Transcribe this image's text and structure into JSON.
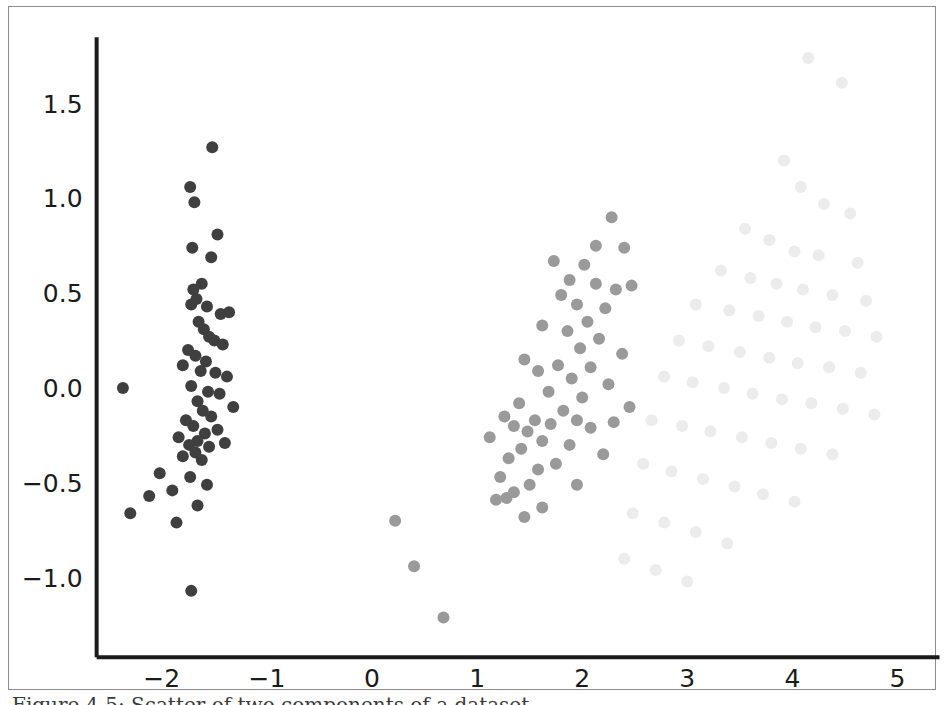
{
  "figure": {
    "background_color": "#ffffff",
    "frame_color": "#8d8d8d",
    "axis_color": "#1b1b1b"
  },
  "caption": {
    "text": "Figure 4-5: Scatter of two components of a dataset"
  },
  "chart_data": {
    "type": "scatter",
    "title": "",
    "xlabel": "",
    "ylabel": "",
    "xlim": [
      -2.62,
      5.4
    ],
    "ylim": [
      -1.42,
      1.85
    ],
    "xticks": [
      -2,
      -1,
      0,
      1,
      2,
      3,
      4,
      5
    ],
    "xticklabels": [
      "−2",
      "−1",
      "0",
      "1",
      "2",
      "3",
      "4",
      "5"
    ],
    "yticks": [
      -1.0,
      -0.5,
      0.0,
      0.5,
      1.0,
      1.5
    ],
    "yticklabels": [
      "−1.0",
      "−0.5",
      "0.0",
      "0.5",
      "1.0",
      "1.5"
    ],
    "grid": false,
    "legend": null,
    "marker": "circle",
    "marker_size": 11,
    "spines": {
      "left": true,
      "bottom": true,
      "top": false,
      "right": false
    },
    "series": [
      {
        "name": "cluster-dark",
        "color": "#3f3f3f",
        "opacity": 1.0,
        "points": [
          [
            -1.52,
            1.27
          ],
          [
            -1.73,
            1.06
          ],
          [
            -1.69,
            0.98
          ],
          [
            -1.47,
            0.81
          ],
          [
            -1.71,
            0.74
          ],
          [
            -1.53,
            0.69
          ],
          [
            -1.62,
            0.55
          ],
          [
            -1.7,
            0.52
          ],
          [
            -1.67,
            0.47
          ],
          [
            -1.72,
            0.44
          ],
          [
            -1.57,
            0.43
          ],
          [
            -1.36,
            0.4
          ],
          [
            -1.44,
            0.39
          ],
          [
            -1.65,
            0.35
          ],
          [
            -1.6,
            0.31
          ],
          [
            -1.55,
            0.27
          ],
          [
            -1.5,
            0.25
          ],
          [
            -1.42,
            0.23
          ],
          [
            -1.75,
            0.2
          ],
          [
            -1.68,
            0.17
          ],
          [
            -1.58,
            0.14
          ],
          [
            -1.8,
            0.12
          ],
          [
            -1.63,
            0.09
          ],
          [
            -1.49,
            0.08
          ],
          [
            -1.38,
            0.06
          ],
          [
            -2.37,
            0.0
          ],
          [
            -1.72,
            0.01
          ],
          [
            -1.56,
            -0.02
          ],
          [
            -1.45,
            -0.03
          ],
          [
            -1.66,
            -0.07
          ],
          [
            -1.32,
            -0.1
          ],
          [
            -1.61,
            -0.12
          ],
          [
            -1.53,
            -0.15
          ],
          [
            -1.77,
            -0.17
          ],
          [
            -1.7,
            -0.2
          ],
          [
            -1.47,
            -0.22
          ],
          [
            -1.59,
            -0.24
          ],
          [
            -1.84,
            -0.26
          ],
          [
            -1.66,
            -0.28
          ],
          [
            -1.74,
            -0.3
          ],
          [
            -1.55,
            -0.31
          ],
          [
            -1.4,
            -0.29
          ],
          [
            -1.68,
            -0.34
          ],
          [
            -1.8,
            -0.36
          ],
          [
            -1.62,
            -0.38
          ],
          [
            -2.02,
            -0.45
          ],
          [
            -1.73,
            -0.47
          ],
          [
            -1.9,
            -0.54
          ],
          [
            -1.57,
            -0.51
          ],
          [
            -2.12,
            -0.57
          ],
          [
            -1.66,
            -0.62
          ],
          [
            -2.3,
            -0.66
          ],
          [
            -1.86,
            -0.71
          ],
          [
            -1.72,
            -1.07
          ]
        ]
      },
      {
        "name": "cluster-mid-gray",
        "color": "#9a9a9a",
        "opacity": 1.0,
        "points": [
          [
            2.28,
            0.9
          ],
          [
            2.13,
            0.75
          ],
          [
            2.4,
            0.74
          ],
          [
            1.73,
            0.67
          ],
          [
            2.02,
            0.65
          ],
          [
            1.88,
            0.57
          ],
          [
            2.13,
            0.55
          ],
          [
            2.47,
            0.54
          ],
          [
            2.32,
            0.52
          ],
          [
            1.8,
            0.49
          ],
          [
            1.95,
            0.44
          ],
          [
            2.22,
            0.42
          ],
          [
            2.05,
            0.35
          ],
          [
            1.62,
            0.33
          ],
          [
            1.86,
            0.3
          ],
          [
            2.16,
            0.26
          ],
          [
            1.98,
            0.21
          ],
          [
            2.38,
            0.18
          ],
          [
            1.45,
            0.15
          ],
          [
            1.77,
            0.12
          ],
          [
            2.08,
            0.11
          ],
          [
            1.58,
            0.09
          ],
          [
            1.9,
            0.05
          ],
          [
            2.25,
            0.02
          ],
          [
            1.68,
            -0.02
          ],
          [
            2.0,
            -0.05
          ],
          [
            1.4,
            -0.08
          ],
          [
            2.45,
            -0.1
          ],
          [
            1.82,
            -0.12
          ],
          [
            1.26,
            -0.15
          ],
          [
            1.55,
            -0.17
          ],
          [
            1.95,
            -0.17
          ],
          [
            2.3,
            -0.18
          ],
          [
            1.7,
            -0.19
          ],
          [
            1.35,
            -0.2
          ],
          [
            1.48,
            -0.23
          ],
          [
            1.12,
            -0.26
          ],
          [
            2.08,
            -0.21
          ],
          [
            1.62,
            -0.28
          ],
          [
            1.88,
            -0.3
          ],
          [
            1.42,
            -0.32
          ],
          [
            2.2,
            -0.35
          ],
          [
            1.3,
            -0.37
          ],
          [
            1.75,
            -0.4
          ],
          [
            1.58,
            -0.43
          ],
          [
            1.22,
            -0.47
          ],
          [
            1.5,
            -0.51
          ],
          [
            1.95,
            -0.51
          ],
          [
            1.35,
            -0.55
          ],
          [
            1.28,
            -0.58
          ],
          [
            1.18,
            -0.59
          ],
          [
            1.62,
            -0.63
          ],
          [
            1.45,
            -0.68
          ],
          [
            0.22,
            -0.7
          ],
          [
            0.4,
            -0.94
          ],
          [
            0.68,
            -1.21
          ]
        ]
      },
      {
        "name": "cluster-faint",
        "color": "#ececec",
        "opacity": 1.0,
        "points": [
          [
            4.15,
            1.74
          ],
          [
            4.47,
            1.61
          ],
          [
            3.92,
            1.2
          ],
          [
            4.08,
            1.06
          ],
          [
            4.3,
            0.97
          ],
          [
            4.55,
            0.92
          ],
          [
            3.55,
            0.84
          ],
          [
            3.78,
            0.78
          ],
          [
            4.02,
            0.72
          ],
          [
            4.25,
            0.7
          ],
          [
            4.62,
            0.66
          ],
          [
            3.32,
            0.62
          ],
          [
            3.6,
            0.58
          ],
          [
            3.85,
            0.55
          ],
          [
            4.1,
            0.52
          ],
          [
            4.38,
            0.49
          ],
          [
            4.7,
            0.46
          ],
          [
            3.08,
            0.44
          ],
          [
            3.4,
            0.41
          ],
          [
            3.68,
            0.38
          ],
          [
            3.95,
            0.35
          ],
          [
            4.22,
            0.32
          ],
          [
            4.5,
            0.3
          ],
          [
            4.8,
            0.27
          ],
          [
            2.92,
            0.25
          ],
          [
            3.2,
            0.22
          ],
          [
            3.5,
            0.19
          ],
          [
            3.78,
            0.16
          ],
          [
            4.05,
            0.13
          ],
          [
            4.35,
            0.11
          ],
          [
            4.65,
            0.08
          ],
          [
            2.78,
            0.06
          ],
          [
            3.05,
            0.03
          ],
          [
            3.35,
            0.0
          ],
          [
            3.62,
            -0.03
          ],
          [
            3.9,
            -0.06
          ],
          [
            4.18,
            -0.08
          ],
          [
            4.48,
            -0.11
          ],
          [
            4.78,
            -0.14
          ],
          [
            2.66,
            -0.17
          ],
          [
            2.95,
            -0.2
          ],
          [
            3.22,
            -0.23
          ],
          [
            3.52,
            -0.26
          ],
          [
            3.8,
            -0.29
          ],
          [
            4.08,
            -0.32
          ],
          [
            4.38,
            -0.35
          ],
          [
            2.58,
            -0.4
          ],
          [
            2.85,
            -0.44
          ],
          [
            3.15,
            -0.48
          ],
          [
            3.45,
            -0.52
          ],
          [
            3.72,
            -0.56
          ],
          [
            4.02,
            -0.6
          ],
          [
            2.48,
            -0.66
          ],
          [
            2.78,
            -0.71
          ],
          [
            3.08,
            -0.76
          ],
          [
            3.38,
            -0.82
          ],
          [
            2.4,
            -0.9
          ],
          [
            2.7,
            -0.96
          ],
          [
            3.0,
            -1.02
          ]
        ]
      }
    ]
  }
}
